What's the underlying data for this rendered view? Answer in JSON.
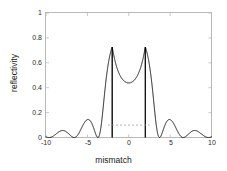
{
  "chart_data": {
    "type": "line",
    "title": "",
    "xlabel": "mismatch",
    "ylabel": "reflectivity",
    "xlim": [
      -10,
      10
    ],
    "ylim": [
      0,
      1
    ],
    "xticks": [
      -10,
      -5,
      0,
      5,
      10
    ],
    "xtick_labels": [
      "-10",
      "-5",
      "0",
      "5",
      "10"
    ],
    "yticks": [
      0,
      0.2,
      0.4,
      0.6,
      0.8,
      1
    ],
    "ytick_labels": [
      "0",
      "0.2",
      "0.4",
      "0.6",
      "0.8",
      "1"
    ],
    "grid": false,
    "legend": null,
    "series": [
      {
        "name": "reflectivity",
        "style": "solid",
        "color": "#000000",
        "peak_x": 0,
        "peak_y": 0.91,
        "description": "Bragg reflectivity spectrum: broad central lobe peaking at 0.91 at mismatch 0, falling to zero near mismatch -2.7 and +2.7, followed by decaying oscillatory sidelobes out to mismatch -10 and +10",
        "x": [
          -10.0,
          -9.8,
          -9.6,
          -9.4,
          -9.2,
          -9.0,
          -8.8,
          -8.6,
          -8.4,
          -8.2,
          -8.0,
          -7.8,
          -7.6,
          -7.4,
          -7.2,
          -7.0,
          -6.8,
          -6.6,
          -6.4,
          -6.2,
          -6.0,
          -5.8,
          -5.6,
          -5.4,
          -5.2,
          -5.0,
          -4.8,
          -4.6,
          -4.4,
          -4.2,
          -4.0,
          -3.8,
          -3.6,
          -3.4,
          -3.2,
          -3.0,
          -2.9,
          -2.8,
          -2.7,
          -2.6,
          -2.5,
          -2.4,
          -2.2,
          -2.0,
          -1.8,
          -1.6,
          -1.4,
          -1.2,
          -1.0,
          -0.8,
          -0.6,
          -0.4,
          -0.2,
          0.0,
          0.2,
          0.4,
          0.6,
          0.8,
          1.0,
          1.2,
          1.4,
          1.6,
          1.8,
          2.0,
          2.2,
          2.4,
          2.5,
          2.6,
          2.7,
          2.8,
          2.9,
          3.0,
          3.2,
          3.4,
          3.6,
          3.8,
          4.0,
          4.2,
          4.4,
          4.6,
          4.8,
          5.0,
          5.2,
          5.4,
          5.6,
          5.8,
          6.0,
          6.2,
          6.4,
          6.6,
          6.8,
          7.0,
          7.2,
          7.4,
          7.6,
          7.8,
          8.0,
          8.2,
          8.4,
          8.6,
          8.8,
          9.0,
          9.2,
          9.4,
          9.6,
          9.8,
          10.0
        ],
        "y": [
          0.0,
          0.018,
          0.028,
          0.019,
          0.002,
          0.0,
          0.014,
          0.03,
          0.024,
          0.005,
          0.0,
          0.011,
          0.031,
          0.03,
          0.009,
          0.0,
          0.009,
          0.033,
          0.037,
          0.014,
          0.0,
          0.008,
          0.036,
          0.046,
          0.021,
          0.0,
          0.009,
          0.043,
          0.062,
          0.034,
          0.001,
          0.014,
          0.06,
          0.098,
          0.066,
          0.004,
          0.06,
          0.19,
          0.33,
          0.18,
          0.06,
          0.21,
          0.47,
          0.64,
          0.76,
          0.83,
          0.872,
          0.893,
          0.903,
          0.908,
          0.91,
          0.911,
          0.911,
          0.911,
          0.911,
          0.911,
          0.91,
          0.908,
          0.903,
          0.893,
          0.872,
          0.83,
          0.76,
          0.64,
          0.47,
          0.21,
          0.06,
          0.18,
          0.33,
          0.19,
          0.06,
          0.004,
          0.066,
          0.098,
          0.06,
          0.014,
          0.001,
          0.034,
          0.062,
          0.043,
          0.009,
          0.0,
          0.021,
          0.046,
          0.036,
          0.008,
          0.0,
          0.014,
          0.037,
          0.033,
          0.009,
          0.0,
          0.009,
          0.03,
          0.031,
          0.011,
          0.0,
          0.005,
          0.024,
          0.03,
          0.014,
          0.0,
          0.002,
          0.019,
          0.028,
          0.018,
          0.0
        ]
      },
      {
        "name": "reference level",
        "style": "dashed",
        "color": "#9a9a9a",
        "description": "faint horizontal dashed reference line at reflectivity 0.10 spanning the main lobe from mismatch -2.5 to 2.5",
        "level": 0.1,
        "x_start": -2.5,
        "x_end": 2.5
      }
    ]
  }
}
